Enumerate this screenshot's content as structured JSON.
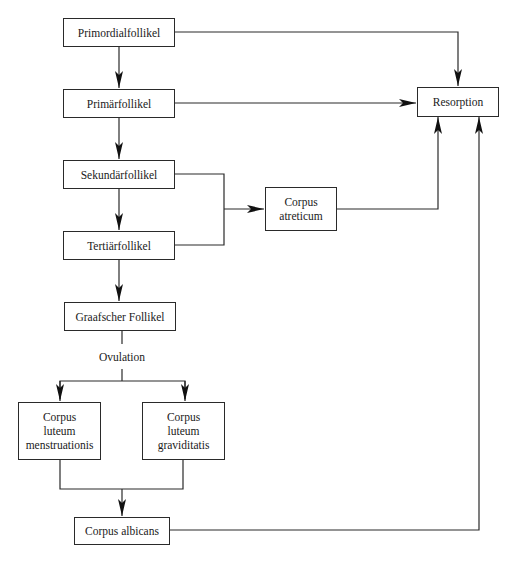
{
  "diagram": {
    "type": "flowchart",
    "nodes": {
      "primordial": {
        "label": "Primordialfollikel"
      },
      "primaer": {
        "label": "Primärfollikel"
      },
      "sekundaer": {
        "label": "Sekundärfollikel"
      },
      "tertiaer": {
        "label": "Tertiärfollikel"
      },
      "graaf": {
        "label": "Graafscher Follikel"
      },
      "clm": {
        "label": "Corpus\nluteum\nmenstruationis"
      },
      "clg": {
        "label": "Corpus\nluteum\ngraviditatis"
      },
      "albicans": {
        "label": "Corpus albicans"
      },
      "atreticum": {
        "label": "Corpus\natreticum"
      },
      "resorption": {
        "label": "Resorption"
      }
    },
    "edge_labels": {
      "ovulation": "Ovulation"
    },
    "edges": [
      {
        "from": "Primordialfollikel",
        "to": "Primärfollikel"
      },
      {
        "from": "Primärfollikel",
        "to": "Sekundärfollikel"
      },
      {
        "from": "Sekundärfollikel",
        "to": "Tertiärfollikel"
      },
      {
        "from": "Tertiärfollikel",
        "to": "Graafscher Follikel"
      },
      {
        "from": "Graafscher Follikel",
        "to": "Corpus luteum menstruationis",
        "label": "Ovulation"
      },
      {
        "from": "Graafscher Follikel",
        "to": "Corpus luteum graviditatis",
        "label": "Ovulation"
      },
      {
        "from": "Corpus luteum menstruationis",
        "to": "Corpus albicans"
      },
      {
        "from": "Corpus luteum graviditatis",
        "to": "Corpus albicans"
      },
      {
        "from": "Sekundärfollikel",
        "to": "Corpus atreticum"
      },
      {
        "from": "Tertiärfollikel",
        "to": "Corpus atreticum"
      },
      {
        "from": "Primordialfollikel",
        "to": "Resorption"
      },
      {
        "from": "Primärfollikel",
        "to": "Resorption"
      },
      {
        "from": "Corpus atreticum",
        "to": "Resorption"
      },
      {
        "from": "Corpus albicans",
        "to": "Resorption"
      }
    ]
  }
}
